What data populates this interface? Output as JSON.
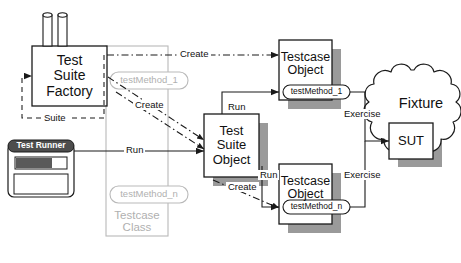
{
  "diagram": {
    "colors": {
      "stroke": "#1a1a1a",
      "shadow": "#9a9a9a",
      "ghost": "#b9b9b9",
      "background": "#ffffff",
      "titlebar": "#4d4d4d",
      "progress_fill": "#5a5a5a"
    }
  },
  "nodes": {
    "test_suite_factory": {
      "label_line1": "Test",
      "label_line2": "Suite",
      "label_line3": "Factory"
    },
    "test_runner": {
      "title": "Test Runner"
    },
    "testcase_class": {
      "label_line1": "Testcase",
      "label_line2": "Class",
      "method_first": "testMethod_1",
      "method_last": "testMethod_n"
    },
    "test_suite_object": {
      "label_line1": "Test",
      "label_line2": "Suite",
      "label_line3": "Object"
    },
    "testcase_object_first": {
      "label_line1": "Testcase",
      "label_line2": "Object",
      "method": "testMethod_1"
    },
    "testcase_object_last": {
      "label_line1": "Testcase",
      "label_line2": "Object",
      "method": "testMethod_n"
    },
    "fixture": {
      "label": "Fixture"
    },
    "sut": {
      "label": "SUT"
    }
  },
  "edges": {
    "create_top": "Create",
    "create_mid": "Create",
    "create_bottom": "Create",
    "suite_feedback": "Suite",
    "run_runner": "Run",
    "run_first": "Run",
    "run_last": "Run",
    "exercise_first": "Exercise",
    "exercise_last": "Exercise"
  }
}
